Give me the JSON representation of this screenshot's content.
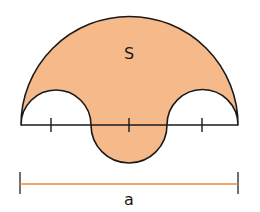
{
  "figure": {
    "region_label": "S",
    "dimension_label": "a",
    "colors": {
      "fill": "#f6b98a",
      "stroke": "#1a1a1a",
      "dimension_line": "#e8883a",
      "background": "#ffffff"
    },
    "tick_count": 3
  }
}
